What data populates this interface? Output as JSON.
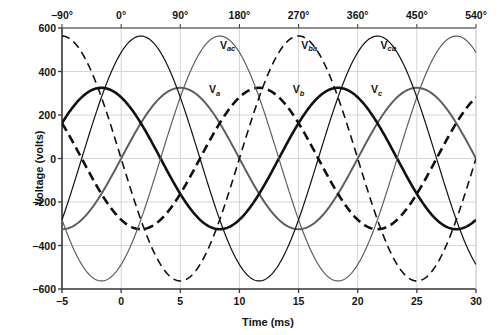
{
  "chart_data": {
    "type": "line",
    "title": "",
    "xlabel": "Time (ms)",
    "ylabel": "Voltage (volts)",
    "xlabel_top": "",
    "xlim": [
      -5,
      30
    ],
    "ylim": [
      -600,
      600
    ],
    "xticks": [
      -5,
      0,
      5,
      10,
      15,
      20,
      25,
      30
    ],
    "xticklabels": [
      "−5",
      "0",
      "5",
      "10",
      "15",
      "20",
      "25",
      "30"
    ],
    "xticks_top_deg": [
      -90,
      0,
      90,
      180,
      270,
      360,
      450,
      540
    ],
    "xticklabels_top": [
      "−90°",
      "0°",
      "90°",
      "180°",
      "270°",
      "360°",
      "450°",
      "540°"
    ],
    "yticks": [
      600,
      400,
      200,
      0,
      -200,
      -400,
      -600
    ],
    "yticklabels": [
      "600",
      "400",
      "200",
      "0",
      "−200",
      "−400",
      "−600"
    ],
    "grid": true,
    "legend": "inline-annotations",
    "period_ms": 20,
    "phase_amplitude": 325,
    "line_amplitude": 563,
    "series": [
      {
        "name": "Va",
        "label": "V",
        "sub": "a",
        "amplitude": 325,
        "phase_deg": 0,
        "color": "#5f5f5f",
        "width": 2.0,
        "dash": "none",
        "label_x_ms": 7.9,
        "label_y_v": 300
      },
      {
        "name": "Vb",
        "label": "V",
        "sub": "b",
        "amplitude": 325,
        "phase_deg": -120,
        "color": "#111111",
        "width": 2.6,
        "dash": "9,5",
        "label_x_ms": 15.0,
        "label_y_v": 300
      },
      {
        "name": "Vc",
        "label": "V",
        "sub": "c",
        "amplitude": 325,
        "phase_deg": -240,
        "color": "#111111",
        "width": 2.6,
        "dash": "none",
        "label_x_ms": 21.6,
        "label_y_v": 300
      },
      {
        "name": "Vac",
        "label": "V",
        "sub": "ac",
        "amplitude": 563,
        "phase_deg": -60,
        "color": "#5f5f5f",
        "width": 1.2,
        "dash": "none",
        "label_x_ms": 9.0,
        "label_y_v": 505
      },
      {
        "name": "Vba",
        "label": "V",
        "sub": "ba",
        "amplitude": 563,
        "phase_deg": -180,
        "color": "#111111",
        "width": 1.6,
        "dash": "8,5",
        "label_x_ms": 15.9,
        "label_y_v": 505
      },
      {
        "name": "Vcb",
        "label": "V",
        "sub": "cb",
        "amplitude": 563,
        "phase_deg": -300,
        "color": "#111111",
        "width": 1.2,
        "dash": "none",
        "label_x_ms": 22.6,
        "label_y_v": 505
      }
    ],
    "colors": {
      "axis": "#3a3a3a",
      "grid": "#d0d0d0",
      "text": "#141414",
      "gray_series": "#5f5f5f",
      "black_series": "#111111"
    }
  }
}
